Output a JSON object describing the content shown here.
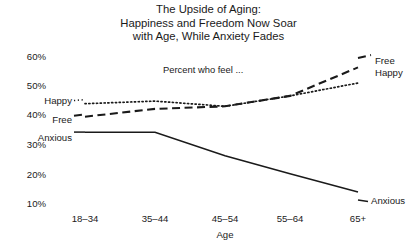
{
  "title": {
    "line1": "The Upside of Aging:",
    "line2": "Happiness and Freedom Now Soar",
    "line3": "with Age, While Anxiety Fades"
  },
  "annotation": "Percent who feel ...",
  "axis": {
    "x_title": "Age",
    "y_ticks": [
      "60%",
      "50%",
      "40%",
      "30%",
      "20%",
      "10%"
    ],
    "x_ticks": [
      "18–34",
      "35–44",
      "45–54",
      "55–64",
      "65+"
    ]
  },
  "labels": {
    "left_happy": "Happy",
    "left_free": "Free",
    "left_anxious": "Anxious",
    "right_free": "Free",
    "right_happy": "Happy",
    "right_anxious": "Anxious"
  },
  "colors": {
    "line": "#1a1a1a",
    "text": "#1a1a1a",
    "background": "#ffffff"
  },
  "chart_data": {
    "type": "line",
    "title": "The Upside of Aging: Happiness and Freedom Now Soar with Age, While Anxiety Fades",
    "subtitle": "Percent who feel ...",
    "xlabel": "Age",
    "ylabel": "",
    "categories": [
      "18–34",
      "35–44",
      "45–54",
      "55–64",
      "65+"
    ],
    "ylim": [
      5,
      62
    ],
    "yticks": [
      10,
      20,
      30,
      40,
      50,
      60
    ],
    "ytick_labels": [
      "10%",
      "20%",
      "30%",
      "40%",
      "50%",
      "60%"
    ],
    "grid": false,
    "legend": "inline-endpoint-labels",
    "series": [
      {
        "name": "Happy",
        "style": "dotted",
        "values": [
          44,
          45,
          43,
          47,
          52
        ]
      },
      {
        "name": "Free",
        "style": "dashed",
        "values": [
          39,
          42,
          43,
          47,
          58
        ]
      },
      {
        "name": "Anxious",
        "style": "solid",
        "values": [
          33,
          33,
          24,
          17,
          10
        ]
      }
    ]
  }
}
